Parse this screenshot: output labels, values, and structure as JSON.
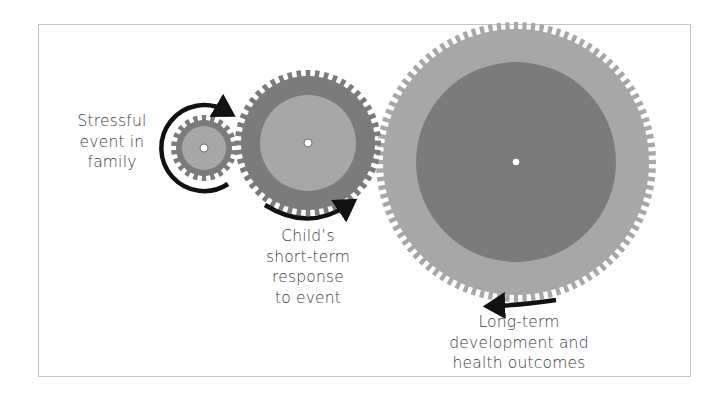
{
  "diagram": {
    "type": "gear-chain",
    "colors": {
      "frame_border": "#c4c4c4",
      "gear_dark": "#7b7b7b",
      "gear_light": "#a7a7a7",
      "hub_hole": "#ffffff",
      "arrow": "#111111",
      "text": "#3a3a3a"
    },
    "gears": [
      {
        "id": "stressful-event",
        "cx": 204,
        "cy": 148,
        "outer_r": 33,
        "root_r": 28,
        "inner_r": 22,
        "teeth": 22,
        "body_color": "#7b7b7b",
        "inner_color": "#a7a7a7",
        "label_lines": [
          "Stressful",
          "event in",
          "family"
        ]
      },
      {
        "id": "short-term-response",
        "cx": 308,
        "cy": 143,
        "outer_r": 73,
        "root_r": 67,
        "inner_r": 48,
        "teeth": 48,
        "body_color": "#7b7b7b",
        "inner_color": "#a7a7a7",
        "label_lines": [
          "Child’s",
          "short-term",
          "response",
          "to event"
        ]
      },
      {
        "id": "long-term-outcomes",
        "cx": 516,
        "cy": 162,
        "outer_r": 140,
        "root_r": 133,
        "inner_r": 100,
        "teeth": 100,
        "body_color": "#a7a7a7",
        "inner_color": "#7b7b7b",
        "label_lines": [
          "Long-term",
          "development and",
          "health outcomes"
        ]
      }
    ],
    "arrows": [
      {
        "id": "small-gear-rotation-arrow",
        "direction": "clockwise",
        "around": "stressful-event"
      },
      {
        "id": "medium-gear-rotation-arrow",
        "direction": "counterclockwise",
        "around": "short-term-response"
      },
      {
        "id": "large-gear-rotation-arrow",
        "direction": "clockwise",
        "around": "long-term-outcomes"
      }
    ]
  },
  "labels": {
    "stressful_event": [
      "Stressful",
      "event in",
      "family"
    ],
    "short_term": [
      "Child’s",
      "short-term",
      "response",
      "to event"
    ],
    "long_term": [
      "Long-term",
      "development and",
      "health outcomes"
    ]
  }
}
